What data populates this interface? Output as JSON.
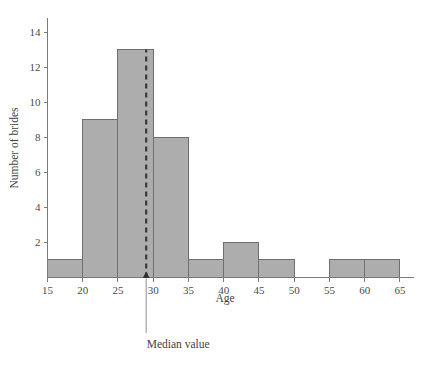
{
  "chart_data": {
    "type": "bar",
    "subtype": "histogram",
    "title": "",
    "xlabel": "Age",
    "ylabel": "Number of brides",
    "xlim": [
      15,
      67
    ],
    "ylim": [
      0,
      14.8
    ],
    "grid": false,
    "legend": null,
    "bin_width": 5,
    "bin_edges": [
      15,
      20,
      25,
      30,
      35,
      40,
      45,
      50,
      55,
      60,
      65
    ],
    "categories": [
      "15-20",
      "20-25",
      "25-30",
      "30-35",
      "35-40",
      "40-45",
      "45-50",
      "50-55",
      "55-60",
      "60-65"
    ],
    "values": [
      1,
      9,
      13,
      8,
      1,
      2,
      1,
      0,
      1,
      1
    ],
    "xticks": [
      15,
      20,
      25,
      30,
      35,
      40,
      45,
      50,
      55,
      60,
      65
    ],
    "xtick_labels": [
      "15",
      "20",
      "25",
      "30",
      "35",
      "40",
      "45",
      "50",
      "55",
      "60",
      "65"
    ],
    "yticks": [
      2,
      4,
      6,
      8,
      10,
      12,
      14
    ],
    "ytick_labels": [
      "2",
      "4",
      "6",
      "8",
      "10",
      "12",
      "14"
    ],
    "bar_fill_color": "#adadad",
    "bar_edge_color": "#6f6f6f",
    "annotations": [
      {
        "name": "median-value",
        "label": "Median value",
        "x_value": 29,
        "line_style": "dashed",
        "line_color": "#3a3a3a"
      }
    ]
  },
  "axes": {
    "x_title": "Age",
    "y_title": "Number of brides"
  }
}
